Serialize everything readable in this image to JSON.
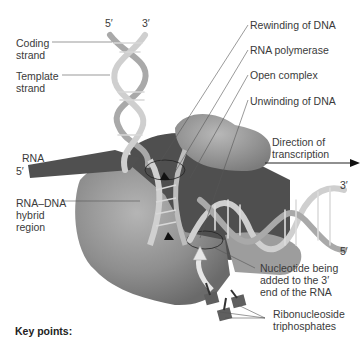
{
  "figure": {
    "labels": {
      "coding_strand": "Coding\nstrand",
      "template_strand": "Template\nstrand",
      "rewinding": "Rewinding of DNA",
      "rna_polymerase": "RNA polymerase",
      "open_complex": "Open complex",
      "unwinding": "Unwinding of DNA",
      "rna": "RNA",
      "rna_5": "5′",
      "hybrid": "RNA–DNA\nhybrid\nregion",
      "direction": "Direction of\ntranscription",
      "nucleotide": "Nucleotide being\nadded to the 3′\nend of the RNA",
      "rntp": "Ribonucleoside\ntriphosphates",
      "top_5": "5′",
      "top_3": "3′",
      "right_3": "3′",
      "right_5": "5′"
    },
    "key_points": "Key points:"
  },
  "colors": {
    "polymerase": "#8c8c8c",
    "dark_core": "#4a4a4a",
    "helix": "#c8c8c8",
    "rna": "#555555",
    "leader": "#666666"
  }
}
